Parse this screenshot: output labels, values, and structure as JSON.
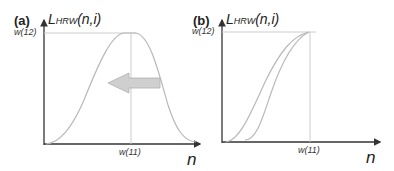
{
  "panels": [
    {
      "id": "a",
      "label": "(a)",
      "ylabel_main": "L",
      "ylabel_sub": "HRW",
      "ylabel_args": "(n,i)",
      "y_tick": "w(12)",
      "x_tick": "w(11)",
      "x_axis_label": "n",
      "description": "Bell-shaped curve peaking at w(11) with left-pointing arrow"
    },
    {
      "id": "b",
      "label": "(b)",
      "ylabel_main": "L",
      "ylabel_sub": "HRW",
      "ylabel_args": "(n,i)",
      "y_tick": "w(12)",
      "x_tick": "w(11)",
      "x_axis_label": "n",
      "description": "Two S-shaped rising curves saturating at w(12) at n = w(11)"
    }
  ],
  "colors": {
    "axis": "#333333",
    "curve": "#b8b8b8",
    "guide": "#cccccc",
    "arrow_fill": "#cfcfcf",
    "arrow_stroke": "#b0b0b0"
  }
}
